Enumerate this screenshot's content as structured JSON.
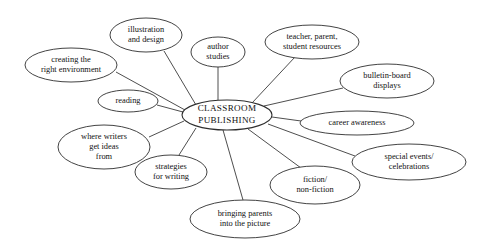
{
  "diagram": {
    "type": "mind-map",
    "background_color": "#ffffff",
    "stroke_color": "#2e2e2e",
    "text_color": "#111111",
    "center": {
      "id": "classroom-publishing",
      "lines": [
        "CLASSROOM",
        "PUBLISHING"
      ],
      "cx": 227,
      "cy": 115,
      "rx": 45,
      "ry": 15
    },
    "nodes": [
      {
        "id": "illustration-and-design",
        "lines": [
          "illustration",
          "and design"
        ],
        "cx": 146,
        "cy": 35,
        "rx": 36,
        "ry": 17
      },
      {
        "id": "author-studies",
        "lines": [
          "author",
          "studies"
        ],
        "cx": 218,
        "cy": 52,
        "rx": 27,
        "ry": 15
      },
      {
        "id": "teacher-parent-student-resources",
        "lines": [
          "teacher, parent,",
          "student resources"
        ],
        "cx": 312,
        "cy": 42,
        "rx": 47,
        "ry": 17
      },
      {
        "id": "creating-the-right-environment",
        "lines": [
          "creating the",
          "right environment"
        ],
        "cx": 71,
        "cy": 65,
        "rx": 46,
        "ry": 17
      },
      {
        "id": "bulletin-board-displays",
        "lines": [
          "bulletin-board",
          "displays"
        ],
        "cx": 387,
        "cy": 81,
        "rx": 47,
        "ry": 17
      },
      {
        "id": "reading",
        "lines": [
          "reading"
        ],
        "cx": 128,
        "cy": 101,
        "rx": 30,
        "ry": 11
      },
      {
        "id": "career-awareness",
        "lines": [
          "career awareness"
        ],
        "cx": 357,
        "cy": 123,
        "rx": 57,
        "ry": 12
      },
      {
        "id": "where-writers-get-ideas-from",
        "lines": [
          "where writers",
          "get ideas",
          "from"
        ],
        "cx": 104,
        "cy": 147,
        "rx": 46,
        "ry": 22
      },
      {
        "id": "special-events-celebrations",
        "lines": [
          "special events/",
          "celebrations"
        ],
        "cx": 409,
        "cy": 162,
        "rx": 57,
        "ry": 18
      },
      {
        "id": "strategies-for-writing",
        "lines": [
          "strategies",
          "for writing"
        ],
        "cx": 171,
        "cy": 172,
        "rx": 36,
        "ry": 17
      },
      {
        "id": "fiction-non-fiction",
        "lines": [
          "fiction/",
          "non-fiction"
        ],
        "cx": 315,
        "cy": 185,
        "rx": 45,
        "ry": 19
      },
      {
        "id": "bringing-parents-into-the-picture",
        "lines": [
          "bringing parents",
          "into the picture"
        ],
        "cx": 245,
        "cy": 219,
        "rx": 55,
        "ry": 19
      }
    ],
    "edges": [
      {
        "from": "classroom-publishing",
        "to": "illustration-and-design",
        "x1": 196,
        "y1": 105,
        "x2": 164,
        "y2": 51
      },
      {
        "from": "classroom-publishing",
        "to": "author-studies",
        "x1": 218,
        "y1": 100,
        "x2": 218,
        "y2": 67
      },
      {
        "from": "classroom-publishing",
        "to": "teacher-parent-student-resources",
        "x1": 252,
        "y1": 103,
        "x2": 295,
        "y2": 57
      },
      {
        "from": "classroom-publishing",
        "to": "creating-the-right-environment",
        "x1": 185,
        "y1": 110,
        "x2": 116,
        "y2": 72
      },
      {
        "from": "classroom-publishing",
        "to": "bulletin-board-displays",
        "x1": 264,
        "y1": 106,
        "x2": 343,
        "y2": 88
      },
      {
        "from": "classroom-publishing",
        "to": "reading",
        "x1": 183,
        "y1": 112,
        "x2": 157,
        "y2": 105
      },
      {
        "from": "classroom-publishing",
        "to": "career-awareness",
        "x1": 272,
        "y1": 117,
        "x2": 301,
        "y2": 121
      },
      {
        "from": "classroom-publishing",
        "to": "where-writers-get-ideas-from",
        "x1": 184,
        "y1": 121,
        "x2": 149,
        "y2": 137
      },
      {
        "from": "classroom-publishing",
        "to": "special-events-celebrations",
        "x1": 268,
        "y1": 124,
        "x2": 355,
        "y2": 156
      },
      {
        "from": "classroom-publishing",
        "to": "strategies-for-writing",
        "x1": 196,
        "y1": 128,
        "x2": 179,
        "y2": 155
      },
      {
        "from": "classroom-publishing",
        "to": "fiction-non-fiction",
        "x1": 248,
        "y1": 129,
        "x2": 301,
        "y2": 168
      },
      {
        "from": "classroom-publishing",
        "to": "bringing-parents-into-the-picture",
        "x1": 223,
        "y1": 130,
        "x2": 243,
        "y2": 200
      }
    ]
  }
}
